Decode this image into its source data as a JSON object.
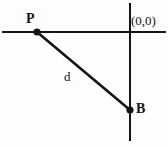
{
  "diagram": {
    "background_color": "#fdfdfd",
    "stroke_color": "#141414",
    "labels": {
      "point_p": "P",
      "point_b": "B",
      "segment_d": "d",
      "origin": "(0,0)"
    },
    "geometry": {
      "horizontal_axis": {
        "x1": 2,
        "y1": 32,
        "x2": 166,
        "y2": 32,
        "stroke_width": 2
      },
      "vertical_axis": {
        "x1": 130,
        "y1": 3,
        "x2": 130,
        "y2": 141,
        "stroke_width": 2
      },
      "hypotenuse": {
        "x1": 37,
        "y1": 32,
        "x2": 130,
        "y2": 110,
        "stroke_width": 2.6
      },
      "point_p": {
        "cx": 37,
        "cy": 32,
        "r": 3.6
      },
      "point_b": {
        "cx": 130,
        "cy": 110,
        "r": 3.6
      }
    }
  }
}
